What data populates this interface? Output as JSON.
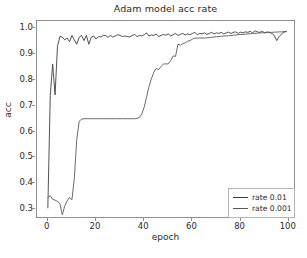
{
  "figure": {
    "title": "Adam model acc rate",
    "background_color": "#ffffff",
    "axis_color": "#8f8f8f",
    "text_color": "#2b2b2b"
  },
  "axes": {
    "xlabel": "epoch",
    "ylabel": "acc",
    "xticks": [
      "0",
      "20",
      "40",
      "60",
      "80",
      "100"
    ],
    "yticks": [
      "0.3",
      "0.4",
      "0.5",
      "0.6",
      "0.7",
      "0.8",
      "0.9",
      "1.0"
    ]
  },
  "legend": {
    "entries": [
      {
        "label": "rate 0.01",
        "color": "#3f3f3f"
      },
      {
        "label": "rate 0.001",
        "color": "#5a5a5a"
      }
    ]
  },
  "chart_data": {
    "type": "line",
    "title": "Adam model acc rate",
    "xlabel": "epoch",
    "ylabel": "acc",
    "xlim": [
      -4.5,
      103
    ],
    "ylim": [
      0.262,
      1.028
    ],
    "grid": false,
    "legend_position": "lower right",
    "xticks": [
      0,
      20,
      40,
      60,
      80,
      100
    ],
    "yticks": [
      0.3,
      0.4,
      0.5,
      0.6,
      0.7,
      0.8,
      0.9,
      1.0
    ],
    "x": [
      0,
      1,
      2,
      3,
      4,
      5,
      6,
      7,
      8,
      9,
      10,
      11,
      12,
      13,
      14,
      15,
      16,
      17,
      18,
      19,
      20,
      21,
      22,
      23,
      24,
      25,
      26,
      27,
      28,
      29,
      30,
      31,
      32,
      33,
      34,
      35,
      36,
      37,
      38,
      39,
      40,
      41,
      42,
      43,
      44,
      45,
      46,
      47,
      48,
      49,
      50,
      51,
      52,
      53,
      54,
      55,
      56,
      57,
      58,
      59,
      60,
      61,
      62,
      63,
      64,
      65,
      66,
      67,
      68,
      69,
      70,
      71,
      72,
      73,
      74,
      75,
      76,
      77,
      78,
      79,
      80,
      81,
      82,
      83,
      84,
      85,
      86,
      87,
      88,
      89,
      90,
      91,
      92,
      93,
      94,
      95,
      96,
      97,
      98,
      99
    ],
    "series": [
      {
        "name": "rate 0.01",
        "color": "#3f3f3f",
        "values": [
          0.305,
          0.74,
          0.862,
          0.742,
          0.93,
          0.968,
          0.966,
          0.955,
          0.962,
          0.948,
          0.972,
          0.955,
          0.938,
          0.965,
          0.972,
          0.952,
          0.972,
          0.938,
          0.965,
          0.97,
          0.958,
          0.968,
          0.966,
          0.972,
          0.972,
          0.965,
          0.972,
          0.966,
          0.97,
          0.975,
          0.972,
          0.968,
          0.97,
          0.968,
          0.966,
          0.972,
          0.976,
          0.968,
          0.972,
          0.97,
          0.975,
          0.982,
          0.97,
          0.974,
          0.972,
          0.978,
          0.968,
          0.972,
          0.976,
          0.973,
          0.978,
          0.97,
          0.975,
          0.98,
          0.972,
          0.976,
          0.98,
          0.974,
          0.978,
          0.975,
          0.98,
          0.984,
          0.975,
          0.98,
          0.978,
          0.982,
          0.976,
          0.98,
          0.984,
          0.978,
          0.982,
          0.98,
          0.984,
          0.978,
          0.982,
          0.985,
          0.98,
          0.984,
          0.986,
          0.98,
          0.985,
          0.982,
          0.986,
          0.984,
          0.988,
          0.982,
          0.99,
          0.986,
          0.984,
          0.988,
          0.982,
          0.986,
          0.984,
          0.98,
          0.972,
          0.952,
          0.968,
          0.978,
          0.985,
          0.987
        ]
      },
      {
        "name": "rate 0.001",
        "color": "#5a5a5a",
        "values": [
          0.345,
          0.352,
          0.338,
          0.335,
          0.33,
          0.322,
          0.278,
          0.312,
          0.332,
          0.345,
          0.336,
          0.42,
          0.57,
          0.64,
          0.648,
          0.65,
          0.65,
          0.65,
          0.65,
          0.65,
          0.65,
          0.65,
          0.65,
          0.65,
          0.65,
          0.65,
          0.65,
          0.65,
          0.65,
          0.65,
          0.65,
          0.65,
          0.65,
          0.65,
          0.65,
          0.65,
          0.65,
          0.651,
          0.655,
          0.668,
          0.695,
          0.735,
          0.775,
          0.805,
          0.83,
          0.845,
          0.84,
          0.852,
          0.862,
          0.862,
          0.862,
          0.875,
          0.893,
          0.891,
          0.938,
          0.934,
          0.94,
          0.944,
          0.95,
          0.952,
          0.958,
          0.962,
          0.962,
          0.962,
          0.962,
          0.962,
          0.963,
          0.964,
          0.965,
          0.966,
          0.967,
          0.968,
          0.969,
          0.97,
          0.97,
          0.971,
          0.972,
          0.973,
          0.974,
          0.975,
          0.976,
          0.976,
          0.977,
          0.978,
          0.979,
          0.98,
          0.98,
          0.981,
          0.982,
          0.982,
          0.983,
          0.983,
          0.984,
          0.984,
          0.985,
          0.985,
          0.986,
          0.986,
          0.987,
          0.988
        ]
      }
    ]
  }
}
